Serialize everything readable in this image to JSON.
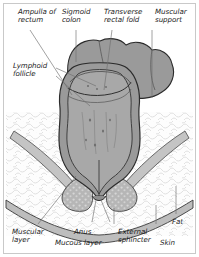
{
  "figure": {
    "style": "medical line illustration, grayscale",
    "frame_color": "#c9c9c9",
    "background": "#ffffff"
  },
  "palette": {
    "bowel_wall_fill": "#9a9a9a",
    "bowel_lumen_fill": "#a8a8a8",
    "mucosa_fill": "#b4b4b4",
    "sphincter_fill": "#b0b0b0",
    "fat_fill": "#fbfbfb",
    "fat_stipple": "#d9d9d9",
    "skin_fill": "#bdbdbd",
    "outline": "#2b2b2b",
    "leader_line": "#6f6f6f",
    "text": "#1a1a1a"
  },
  "labels": [
    {
      "id": "ampulla-of-rectum",
      "text": "Ampulla of\nrectum",
      "x": 18,
      "y": 8,
      "align": "left",
      "group": "top"
    },
    {
      "id": "sigmoid-colon",
      "text": "Sigmoid\ncolon",
      "x": 62,
      "y": 8,
      "align": "left",
      "group": "top"
    },
    {
      "id": "transverse-rectal-fold",
      "text": "Transverse\nrectal fold",
      "x": 104,
      "y": 8,
      "align": "left",
      "group": "top"
    },
    {
      "id": "muscular-support",
      "text": "Muscular\nsupport",
      "x": 155,
      "y": 8,
      "align": "left",
      "group": "top"
    },
    {
      "id": "lymphoid-follicle",
      "text": "Lymphoid\nfollicle",
      "x": 13,
      "y": 62,
      "align": "left",
      "group": "left"
    },
    {
      "id": "muscular-layer",
      "text": "Muscular\nlayer",
      "x": 12,
      "y": 228,
      "align": "left",
      "group": "bottom"
    },
    {
      "id": "anus",
      "text": "Anus",
      "x": 74,
      "y": 228,
      "align": "left",
      "group": "bottom"
    },
    {
      "id": "mucous-layer",
      "text": "Mucous layer",
      "x": 55,
      "y": 239,
      "align": "left",
      "group": "bottom"
    },
    {
      "id": "external-sphincter",
      "text": "External\nsphincter",
      "x": 118,
      "y": 228,
      "align": "left",
      "group": "bottom"
    },
    {
      "id": "skin",
      "text": "Skin",
      "x": 160,
      "y": 239,
      "align": "left",
      "group": "bottom"
    },
    {
      "id": "fat",
      "text": "Fat",
      "x": 172,
      "y": 218,
      "align": "left",
      "group": "bottom"
    }
  ],
  "leaders": [
    {
      "id": "leader-ampulla-of-rectum",
      "from": [
        30,
        30
      ],
      "to": [
        72,
        95
      ]
    },
    {
      "id": "leader-sigmoid-colon",
      "from": [
        76,
        30
      ],
      "to": [
        76,
        62
      ]
    },
    {
      "id": "leader-transverse-rectal-fold",
      "from": [
        112,
        30
      ],
      "to": [
        104,
        90
      ]
    },
    {
      "id": "leader-muscular-support",
      "from": [
        152,
        30
      ],
      "to": [
        152,
        98
      ]
    },
    {
      "id": "leader-lymphoid-follicle-a",
      "from": [
        56,
        68
      ],
      "to": [
        96,
        86
      ]
    },
    {
      "id": "leader-lymphoid-follicle-b",
      "from": [
        56,
        76
      ],
      "to": [
        90,
        106
      ]
    },
    {
      "id": "leader-muscular-layer",
      "from": [
        38,
        224
      ],
      "to": [
        76,
        176
      ]
    },
    {
      "id": "leader-anus",
      "from": [
        92,
        222
      ],
      "to": [
        96,
        200
      ]
    },
    {
      "id": "leader-mucous-layer",
      "from": [
        110,
        222
      ],
      "to": [
        101,
        200
      ]
    },
    {
      "id": "leader-external-sphincter",
      "from": [
        114,
        224
      ],
      "to": [
        114,
        208
      ]
    },
    {
      "id": "leader-skin",
      "from": [
        156,
        224
      ],
      "to": [
        156,
        205
      ]
    },
    {
      "id": "leader-fat",
      "from": [
        176,
        214
      ],
      "to": [
        176,
        186
      ]
    }
  ],
  "structures": [
    "sigmoid colon",
    "ampulla of rectum",
    "transverse rectal fold",
    "muscular support",
    "lymphoid follicle",
    "muscular layer",
    "mucous layer",
    "anus",
    "external sphincter",
    "skin",
    "fat"
  ]
}
